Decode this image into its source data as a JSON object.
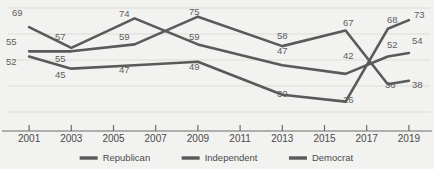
{
  "chart_data": {
    "type": "line",
    "title": "",
    "xlabel": "",
    "ylabel": "",
    "x": [
      2001,
      2003,
      2005,
      2007,
      2009,
      2011,
      2013,
      2015,
      2017,
      2019
    ],
    "xtick_labels": [
      "2001",
      "2003",
      "2005",
      "2007",
      "2009",
      "2011",
      "2013",
      "2015",
      "2017",
      "2019"
    ],
    "ylim": [
      20,
      80
    ],
    "xlim": [
      2000,
      2020
    ],
    "grid": true,
    "grid_axis": "y",
    "legend_position": "bottom-center",
    "series": [
      {
        "name": "Republican",
        "color": "#5a5a5a",
        "points": [
          {
            "x": 2001,
            "y": 69,
            "label": "69"
          },
          {
            "x": 2003,
            "y": 57,
            "label": "57"
          },
          {
            "x": 2006,
            "y": 74,
            "label": "74"
          },
          {
            "x": 2009,
            "y": 59,
            "label": "59"
          },
          {
            "x": 2013,
            "y": 47,
            "label": "47"
          },
          {
            "x": 2016,
            "y": 42,
            "label": "42"
          },
          {
            "x": 2018,
            "y": 52,
            "label": "52"
          },
          {
            "x": 2019,
            "y": 54,
            "label": "54"
          }
        ]
      },
      {
        "name": "Independent",
        "color": "#5a5a5a",
        "points": [
          {
            "x": 2001,
            "y": 55,
            "label": "55"
          },
          {
            "x": 2003,
            "y": 55,
            "label": "55"
          },
          {
            "x": 2006,
            "y": 59,
            "label": "59"
          },
          {
            "x": 2009,
            "y": 75,
            "label": "75"
          },
          {
            "x": 2013,
            "y": 58,
            "label": "58"
          },
          {
            "x": 2016,
            "y": 67,
            "label": "67"
          },
          {
            "x": 2018,
            "y": 36,
            "label": "36"
          },
          {
            "x": 2019,
            "y": 38,
            "label": "38"
          }
        ]
      },
      {
        "name": "Democrat",
        "color": "#5a5a5a",
        "points": [
          {
            "x": 2001,
            "y": 52,
            "label": "52"
          },
          {
            "x": 2003,
            "y": 45,
            "label": "45"
          },
          {
            "x": 2006,
            "y": 47,
            "label": "47"
          },
          {
            "x": 2009,
            "y": 49,
            "label": "49"
          },
          {
            "x": 2013,
            "y": 30,
            "label": "30"
          },
          {
            "x": 2016,
            "y": 26,
            "label": "26"
          },
          {
            "x": 2018,
            "y": 68,
            "label": "68"
          },
          {
            "x": 2019,
            "y": 73,
            "label": "73"
          }
        ]
      }
    ],
    "value_labels": [
      {
        "text": "69",
        "x": 12,
        "y": 16
      },
      {
        "text": "55",
        "x": 6,
        "y": 45
      },
      {
        "text": "52",
        "x": 6,
        "y": 65
      },
      {
        "text": "57",
        "x": 55,
        "y": 40
      },
      {
        "text": "55",
        "x": 55,
        "y": 62
      },
      {
        "text": "45",
        "x": 55,
        "y": 78
      },
      {
        "text": "74",
        "x": 119,
        "y": 17
      },
      {
        "text": "59",
        "x": 119,
        "y": 40
      },
      {
        "text": "47",
        "x": 119,
        "y": 73
      },
      {
        "text": "75",
        "x": 189,
        "y": 15
      },
      {
        "text": "59",
        "x": 189,
        "y": 40
      },
      {
        "text": "49",
        "x": 189,
        "y": 70
      },
      {
        "text": "58",
        "x": 277,
        "y": 39
      },
      {
        "text": "47",
        "x": 277,
        "y": 54
      },
      {
        "text": "30",
        "x": 277,
        "y": 97
      },
      {
        "text": "67",
        "x": 343,
        "y": 26
      },
      {
        "text": "42",
        "x": 343,
        "y": 59
      },
      {
        "text": "26",
        "x": 343,
        "y": 103
      },
      {
        "text": "68",
        "x": 387,
        "y": 23
      },
      {
        "text": "52",
        "x": 387,
        "y": 48
      },
      {
        "text": "36",
        "x": 385,
        "y": 88
      },
      {
        "text": "73",
        "x": 414,
        "y": 18
      },
      {
        "text": "54",
        "x": 412,
        "y": 44
      },
      {
        "text": "38",
        "x": 412,
        "y": 88
      }
    ],
    "legend": [
      {
        "label": "Republican",
        "color": "#5a5a5a"
      },
      {
        "label": "Independent",
        "color": "#5a5a5a"
      },
      {
        "label": "Democrat",
        "color": "#5a5a5a"
      }
    ]
  },
  "colors": {
    "background": "#f2f2f0",
    "grid": "#dcdcd8",
    "axis": "#6b6b6b",
    "label_text": "#5e5e5e",
    "tick_text": "#4a4a4a",
    "line": "#5a5a5a"
  }
}
